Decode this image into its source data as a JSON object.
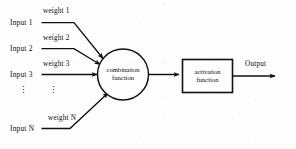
{
  "diagram": {
    "ink_color": "#111111",
    "background_color": "#fdfdfd",
    "inputs": [
      {
        "input_label": "Input  1",
        "weight_label": "weight  1"
      },
      {
        "input_label": "Input  2",
        "weight_label": "weight  2"
      },
      {
        "input_label": "Input  3",
        "weight_label": "weight  3"
      },
      {
        "input_label": "Input  N",
        "weight_label": "weight  N"
      }
    ],
    "ellipsis": "⋮",
    "combination_node": {
      "line1": "combination",
      "line2": "function"
    },
    "activation_node": {
      "line1": "activation",
      "line2": "function"
    },
    "output_label": "Output"
  }
}
